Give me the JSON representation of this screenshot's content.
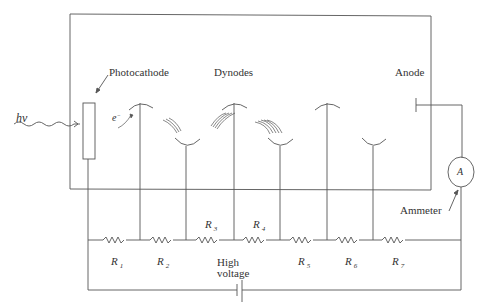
{
  "diagram": {
    "labels": {
      "photon": "hν",
      "photocathode": "Photocathode",
      "dynodes": "Dynodes",
      "anode": "Anode",
      "electron": "e",
      "electron_sup": "−",
      "ammeter_symbol": "A",
      "ammeter": "Ammeter",
      "high_voltage_line1": "High",
      "high_voltage_line2": "voltage"
    },
    "resistors": [
      {
        "name": "R",
        "sub": "1"
      },
      {
        "name": "R",
        "sub": "2"
      },
      {
        "name": "R",
        "sub": "3"
      },
      {
        "name": "R",
        "sub": "4"
      },
      {
        "name": "R",
        "sub": "5"
      },
      {
        "name": "R",
        "sub": "6"
      },
      {
        "name": "R",
        "sub": "7"
      }
    ],
    "colors": {
      "line": "#555555",
      "text": "#333333",
      "background": "#ffffff"
    }
  }
}
